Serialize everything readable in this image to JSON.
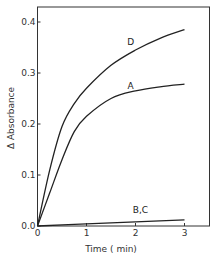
{
  "chart_data": {
    "type": "line",
    "title": "",
    "xlabel": "Time ( min)",
    "ylabel": "Δ Absorbance",
    "xlim": [
      0,
      3.5
    ],
    "ylim": [
      0.0,
      0.42
    ],
    "x_ticks": [
      0,
      1,
      2,
      3
    ],
    "x_tick_labels": [
      "0",
      "1",
      "2",
      "3"
    ],
    "y_ticks": [
      0.0,
      0.1,
      0.2,
      0.3,
      0.4
    ],
    "y_tick_labels": [
      "0.0",
      "0.1",
      "0.2",
      "0.3",
      "0.4"
    ],
    "grid": false,
    "legend": "none (curves labeled directly)",
    "series": [
      {
        "name": "D",
        "x": [
          0,
          0.25,
          0.5,
          0.75,
          1.0,
          1.5,
          2.0,
          2.5,
          3.0
        ],
        "y": [
          0.0,
          0.11,
          0.195,
          0.24,
          0.27,
          0.315,
          0.345,
          0.368,
          0.385
        ]
      },
      {
        "name": "A",
        "x": [
          0,
          0.25,
          0.5,
          0.75,
          1.0,
          1.5,
          2.0,
          2.5,
          3.0
        ],
        "y": [
          0.0,
          0.065,
          0.13,
          0.185,
          0.215,
          0.25,
          0.265,
          0.273,
          0.278
        ]
      },
      {
        "name": "B,C",
        "x": [
          0,
          1.0,
          2.0,
          3.0
        ],
        "y": [
          0.0,
          0.004,
          0.008,
          0.012
        ]
      }
    ],
    "annotations": [
      {
        "text": "D",
        "x": 1.9,
        "y": 0.355
      },
      {
        "text": "A",
        "x": 1.9,
        "y": 0.268
      },
      {
        "text": "B,C",
        "x": 2.1,
        "y": 0.025
      }
    ]
  },
  "labels": {
    "xlabel": "Time ( min)",
    "ylabel": "Δ Absorbance",
    "curve_d": "D",
    "curve_a": "A",
    "curve_bc": "B,C"
  }
}
